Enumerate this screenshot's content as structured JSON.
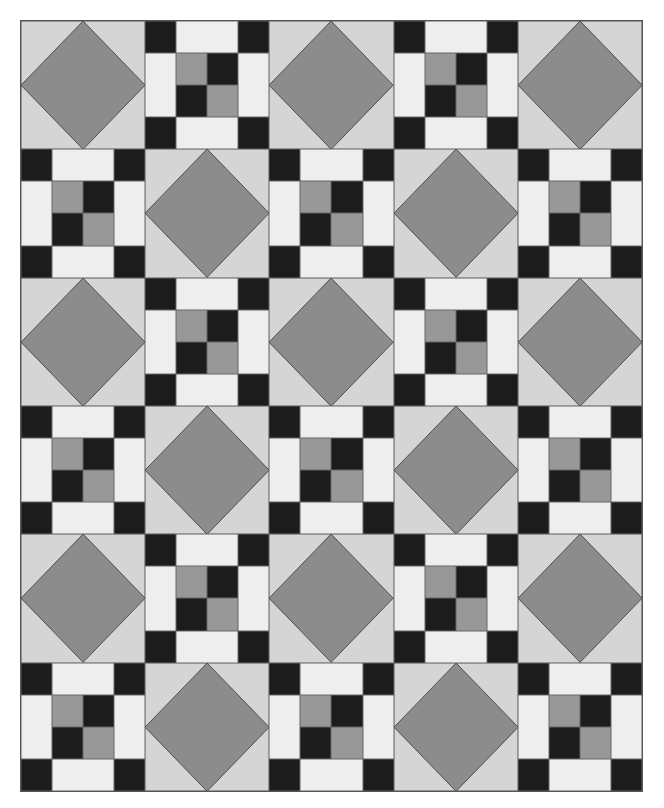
{
  "quilt": {
    "columns": 5,
    "rows": 6,
    "layout": [
      [
        "diamond",
        "ninepatch",
        "diamond",
        "ninepatch",
        "diamond"
      ],
      [
        "ninepatch",
        "diamond",
        "ninepatch",
        "diamond",
        "ninepatch"
      ],
      [
        "diamond",
        "ninepatch",
        "diamond",
        "ninepatch",
        "diamond"
      ],
      [
        "ninepatch",
        "diamond",
        "ninepatch",
        "diamond",
        "ninepatch"
      ],
      [
        "diamond",
        "ninepatch",
        "diamond",
        "ninepatch",
        "diamond"
      ],
      [
        "ninepatch",
        "diamond",
        "ninepatch",
        "diamond",
        "ninepatch"
      ]
    ],
    "colors": {
      "background_light": "#d5d5d5",
      "diamond": "#8c8c8c",
      "black": "#1c1c1c",
      "white": "#eeeeee",
      "center_gray": "#989898",
      "outline": "#555555"
    }
  }
}
